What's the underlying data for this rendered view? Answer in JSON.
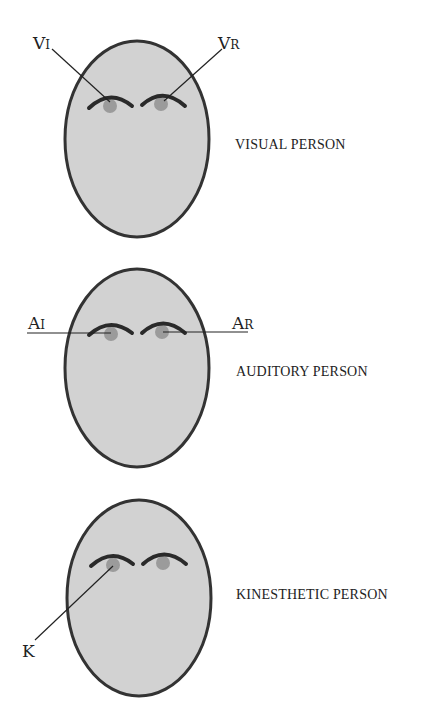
{
  "colors": {
    "face_fill": "#d2d2d2",
    "face_stroke": "#333333",
    "brow": "#2a2a2a",
    "pupil": "#9b9b9b",
    "line": "#222222"
  },
  "faces": [
    {
      "name": "visual",
      "caption": "VISUAL PERSON",
      "labels": [
        {
          "main": "V",
          "sub": "I"
        },
        {
          "main": "V",
          "sub": "R"
        }
      ]
    },
    {
      "name": "auditory",
      "caption": "AUDITORY PERSON",
      "labels": [
        {
          "main": "A",
          "sub": "I"
        },
        {
          "main": "A",
          "sub": "R"
        }
      ]
    },
    {
      "name": "kinesthetic",
      "caption": "KINESTHETIC PERSON",
      "labels": [
        {
          "main": "K"
        }
      ]
    }
  ]
}
